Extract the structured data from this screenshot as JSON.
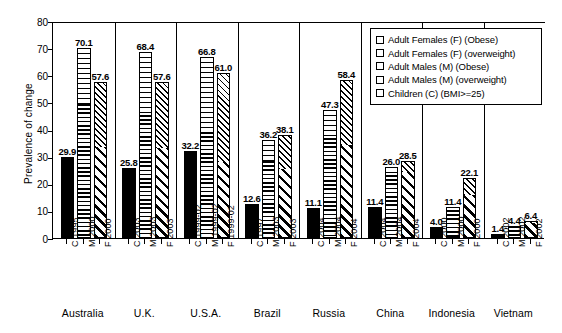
{
  "chart_data": {
    "type": "bar",
    "title": "",
    "subtitle": "",
    "xlabel": "",
    "ylabel": "Prevalence of change",
    "ylim": [
      0,
      80
    ],
    "ytick_step": 10,
    "yticks": [
      "80",
      "70",
      "60",
      "50",
      "40",
      "30",
      "20",
      "10",
      "0"
    ],
    "grid": false,
    "stacked": true,
    "legend_position": "top-right-inside",
    "legend": [
      {
        "label": "Adult Females (F) (Obese)",
        "pattern": "diagonal-hatch-fine"
      },
      {
        "label": "Adult Females (F) (overweight)",
        "pattern": "diagonal-hatch-bold"
      },
      {
        "label": "Adult Males (M) (Obese)",
        "pattern": "horizontal-lines-thin"
      },
      {
        "label": "Adult Males (M) (overweight)",
        "pattern": "horizontal-lines-thick"
      },
      {
        "label": "Children (C) (BMI>=25)",
        "pattern": "solid-black"
      }
    ],
    "categories": [
      "Australia",
      "U.K.",
      "U.S.A.",
      "Brazil",
      "Russia",
      "China",
      "Indonesia",
      "Vietnam"
    ],
    "groups": [
      {
        "country": "Australia",
        "bars": [
          {
            "tick_label": "C 1995",
            "series": "Children (C) (BMI>=25)",
            "total": 29.9,
            "label": "29.9",
            "segments": [
              {
                "name": "children",
                "value": 29.9
              }
            ]
          },
          {
            "tick_label": "M 2000",
            "series": "Adult Males (M)",
            "total": 70.1,
            "label": "70.1",
            "segments": [
              {
                "name": "overweight",
                "value": 49.1
              },
              {
                "name": "obese",
                "value": 21.0
              }
            ]
          },
          {
            "tick_label": "F 2000",
            "series": "Adult Females (F)",
            "total": 57.6,
            "label": "57.6",
            "segments": [
              {
                "name": "overweight",
                "value": 33.3
              },
              {
                "name": "obese",
                "value": 24.3
              }
            ]
          }
        ]
      },
      {
        "country": "U.K.",
        "bars": [
          {
            "tick_label": "C 2003",
            "series": "Children (C) (BMI>=25)",
            "total": 25.8,
            "label": "25.8",
            "segments": [
              {
                "name": "children",
                "value": 25.8
              }
            ]
          },
          {
            "tick_label": "M 2003",
            "series": "Adult Males (M)",
            "total": 68.4,
            "label": "68.4",
            "segments": [
              {
                "name": "overweight",
                "value": 45.0
              },
              {
                "name": "obese",
                "value": 23.4
              }
            ]
          },
          {
            "tick_label": "F 2003",
            "series": "Adult Females (F)",
            "total": 57.6,
            "label": "57.6",
            "segments": [
              {
                "name": "overweight",
                "value": 32.9
              },
              {
                "name": "obese",
                "value": 24.7
              }
            ]
          }
        ]
      },
      {
        "country": "U.S.A.",
        "bars": [
          {
            "tick_label": "C 1999-02",
            "series": "Children (C) (BMI>=25)",
            "total": 32.2,
            "label": "32.2",
            "segments": [
              {
                "name": "children",
                "value": 32.2
              }
            ]
          },
          {
            "tick_label": "M 1999-02",
            "series": "Adult Males (M)",
            "total": 66.8,
            "label": "66.8",
            "segments": [
              {
                "name": "overweight",
                "value": 38.8
              },
              {
                "name": "obese",
                "value": 28.0
              }
            ]
          },
          {
            "tick_label": "F 1999-02",
            "series": "Adult Females (F)",
            "total": 61.0,
            "label": "61.0",
            "segments": [
              {
                "name": "overweight",
                "value": 27.6
              },
              {
                "name": "obese",
                "value": 33.4
              }
            ]
          }
        ]
      },
      {
        "country": "Brazil",
        "bars": [
          {
            "tick_label": "C 1997",
            "series": "Children (C) (BMI>=25)",
            "total": 12.6,
            "label": "12.6",
            "segments": [
              {
                "name": "children",
                "value": 12.6
              }
            ]
          },
          {
            "tick_label": "M 2003",
            "series": "Adult Males (M)",
            "total": 36.2,
            "label": "36.2",
            "segments": [
              {
                "name": "overweight",
                "value": 27.9
              },
              {
                "name": "obese",
                "value": 8.3
              }
            ]
          },
          {
            "tick_label": "F 2003",
            "series": "Adult Females (F)",
            "total": 38.1,
            "label": "38.1",
            "segments": [
              {
                "name": "overweight",
                "value": 25.1
              },
              {
                "name": "obese",
                "value": 13.0
              }
            ]
          }
        ]
      },
      {
        "country": "Russia",
        "bars": [
          {
            "tick_label": "C 2004",
            "series": "Children (C) (BMI>=25)",
            "total": 11.1,
            "label": "11.1",
            "segments": [
              {
                "name": "children",
                "value": 11.1
              }
            ]
          },
          {
            "tick_label": "M 2004",
            "series": "Adult Males (M)",
            "total": 47.3,
            "label": "47.3",
            "segments": [
              {
                "name": "overweight",
                "value": 36.4
              },
              {
                "name": "obese",
                "value": 10.9
              }
            ]
          },
          {
            "tick_label": "F 2004",
            "series": "Adult Females (F)",
            "total": 58.4,
            "label": "58.4",
            "segments": [
              {
                "name": "overweight",
                "value": 33.9
              },
              {
                "name": "obese",
                "value": 24.5
              }
            ]
          }
        ]
      },
      {
        "country": "China",
        "bars": [
          {
            "tick_label": "C 2004",
            "series": "Children (C) (BMI>=25)",
            "total": 11.4,
            "label": "11.4",
            "segments": [
              {
                "name": "children",
                "value": 11.4
              }
            ]
          },
          {
            "tick_label": "M 2004",
            "series": "Adult Males (M)",
            "total": 26.0,
            "label": "26.0",
            "segments": [
              {
                "name": "overweight",
                "value": 22.8
              },
              {
                "name": "obese",
                "value": 3.2
              }
            ]
          },
          {
            "tick_label": "F 2004",
            "series": "Adult Females (F)",
            "total": 28.5,
            "label": "28.5",
            "segments": [
              {
                "name": "overweight",
                "value": 23.8
              },
              {
                "name": "obese",
                "value": 4.7
              }
            ]
          }
        ]
      },
      {
        "country": "Indonesia",
        "bars": [
          {
            "tick_label": "C 2000",
            "series": "Children (C) (BMI>=25)",
            "total": 4.0,
            "label": "4.0",
            "segments": [
              {
                "name": "children",
                "value": 4.0
              }
            ]
          },
          {
            "tick_label": "M 2000",
            "series": "Adult Males (M)",
            "total": 11.4,
            "label": "11.4",
            "segments": [
              {
                "name": "overweight",
                "value": 10.0
              },
              {
                "name": "obese",
                "value": 1.4
              }
            ]
          },
          {
            "tick_label": "F 2000",
            "series": "Adult Females (F)",
            "total": 22.1,
            "label": "22.1",
            "segments": [
              {
                "name": "overweight",
                "value": 15.5
              },
              {
                "name": "obese",
                "value": 6.6
              }
            ]
          }
        ]
      },
      {
        "country": "Vietnam",
        "bars": [
          {
            "tick_label": "C 2002",
            "series": "Children (C) (BMI>=25)",
            "total": 1.4,
            "label": "1.4",
            "segments": [
              {
                "name": "children",
                "value": 1.4
              }
            ]
          },
          {
            "tick_label": "M 2002",
            "series": "Adult Males (M)",
            "total": 4.4,
            "label": "4.4",
            "segments": [
              {
                "name": "overweight",
                "value": 4.0
              },
              {
                "name": "obese",
                "value": 0.4
              }
            ]
          },
          {
            "tick_label": "F 2002",
            "series": "Adult Females (F)",
            "total": 6.4,
            "label": "6.4",
            "segments": [
              {
                "name": "overweight",
                "value": 5.2
              },
              {
                "name": "obese",
                "value": 1.2
              }
            ]
          }
        ]
      }
    ]
  }
}
